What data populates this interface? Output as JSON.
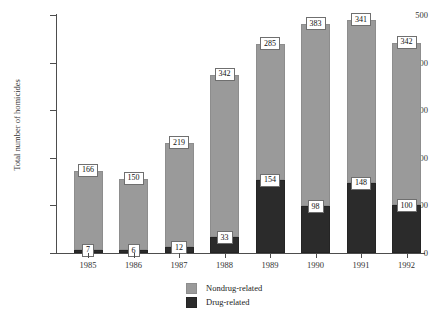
{
  "chart_data": {
    "type": "bar",
    "title": "",
    "subtitle": "",
    "xlabel": "",
    "ylabel": "Total number of homicides",
    "ylim": [
      0,
      500
    ],
    "yticks": [
      0,
      100,
      200,
      300,
      400,
      500
    ],
    "grid": false,
    "stacked": true,
    "legend_position": "bottom-center",
    "categories": [
      "1985",
      "1986",
      "1987",
      "1988",
      "1989",
      "1990",
      "1991",
      "1992"
    ],
    "series": [
      {
        "name": "Drug-related",
        "color": "#2b2b2b",
        "values": [
          7,
          6,
          12,
          33,
          154,
          98,
          148,
          100
        ]
      },
      {
        "name": "Nondrug-related",
        "color": "#9a9a9a",
        "values": [
          166,
          150,
          219,
          342,
          285,
          383,
          341,
          342
        ]
      }
    ],
    "data_labels": {
      "drug": [
        "7",
        "6",
        "12",
        "33",
        "154",
        "98",
        "148",
        "100"
      ],
      "nondrug": [
        "166",
        "150",
        "219",
        "342",
        "285",
        "383",
        "341",
        "342"
      ]
    },
    "totals": [
      173,
      156,
      231,
      375,
      439,
      481,
      489,
      442
    ]
  },
  "axis": {
    "y_tick_labels": [
      "500",
      "400",
      "300",
      "200",
      "100",
      "0"
    ],
    "y_title": "Total number of homicides",
    "x_tick_labels": [
      "1985",
      "1986",
      "1987",
      "1988",
      "1989",
      "1990",
      "1991",
      "1992"
    ]
  },
  "legend": {
    "items": [
      {
        "label": "Nondrug-related",
        "color": "#9a9a9a",
        "swatch": "nondrug-swatch"
      },
      {
        "label": "Drug-related",
        "color": "#2b2b2b",
        "swatch": "drug-swatch"
      }
    ]
  }
}
